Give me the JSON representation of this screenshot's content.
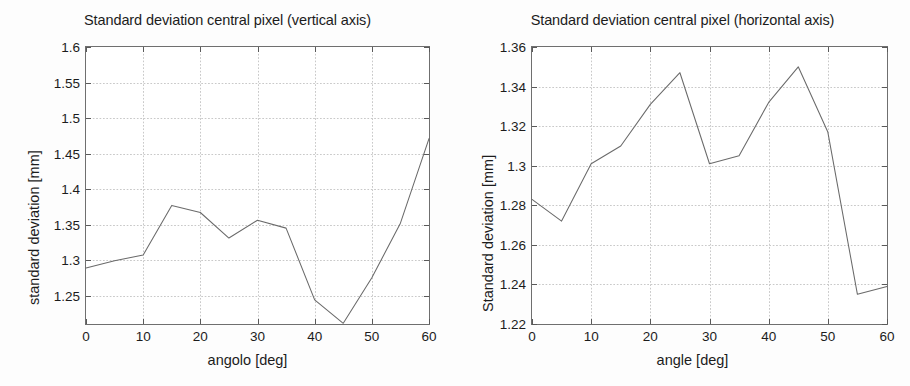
{
  "page": {
    "background": "#fdfdfd",
    "line_color": "#6a6a6a",
    "axis_color": "#6f6f6f",
    "grid_color": "#c9c9c9"
  },
  "figures": [
    {
      "id": "vertical-axis-figure",
      "title": "Standard deviation central pixel (vertical axis)",
      "xlabel": "angolo [deg]",
      "ylabel": "standard deviation [mm]",
      "ytick_labels": [
        "1.6",
        "1.55",
        "1.5",
        "1.45",
        "1.4",
        "1.35",
        "1.3",
        "1.25"
      ],
      "xtick_labels": [
        "0",
        "10",
        "20",
        "30",
        "40",
        "50",
        "60"
      ]
    },
    {
      "id": "horizontal-axis-figure",
      "title": "Standard deviation central pixel (horizontal axis)",
      "xlabel": "angle [deg]",
      "ylabel": "Standard deviation [mm]",
      "ytick_labels": [
        "1.36",
        "1.34",
        "1.32",
        "1.3",
        "1.28",
        "1.26",
        "1.24",
        "1.22"
      ],
      "xtick_labels": [
        "0",
        "10",
        "20",
        "30",
        "40",
        "50",
        "60"
      ]
    }
  ],
  "chart_data": [
    {
      "type": "line",
      "title": "Standard deviation central pixel (vertical axis)",
      "xlabel": "angolo [deg]",
      "ylabel": "standard deviation [mm]",
      "x": [
        0,
        5,
        10,
        15,
        20,
        25,
        30,
        35,
        40,
        45,
        50,
        55,
        60
      ],
      "values": [
        1.289,
        1.299,
        1.307,
        1.377,
        1.367,
        1.331,
        1.356,
        1.345,
        1.244,
        1.211,
        1.275,
        1.352,
        1.471
      ],
      "xlim": [
        0,
        60
      ],
      "ylim": [
        1.21,
        1.6
      ],
      "yticks": [
        1.25,
        1.3,
        1.35,
        1.4,
        1.45,
        1.5,
        1.55,
        1.6
      ],
      "xticks": [
        0,
        10,
        20,
        30,
        40,
        50,
        60
      ],
      "grid": true,
      "legend": "none"
    },
    {
      "type": "line",
      "title": "Standard deviation central pixel (horizontal axis)",
      "xlabel": "angle [deg]",
      "ylabel": "Standard deviation [mm]",
      "x": [
        0,
        5,
        10,
        15,
        20,
        25,
        30,
        35,
        40,
        45,
        50,
        55,
        60
      ],
      "values": [
        1.283,
        1.272,
        1.301,
        1.31,
        1.331,
        1.347,
        1.301,
        1.305,
        1.332,
        1.35,
        1.317,
        1.235,
        1.239
      ],
      "xlim": [
        0,
        60
      ],
      "ylim": [
        1.22,
        1.36
      ],
      "yticks": [
        1.22,
        1.24,
        1.26,
        1.28,
        1.3,
        1.32,
        1.34,
        1.36
      ],
      "xticks": [
        0,
        10,
        20,
        30,
        40,
        50,
        60
      ],
      "grid": true,
      "legend": "none"
    }
  ]
}
